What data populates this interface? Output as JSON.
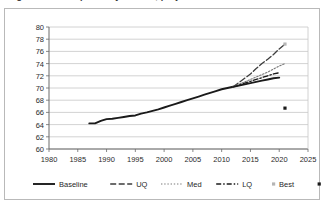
{
  "page": {
    "cutoff_title_fragment": "Figure 3. Life expectancy at birth, projections"
  },
  "chart_data": {
    "type": "line",
    "title": "",
    "xlabel": "",
    "ylabel": "",
    "xlim": [
      1980,
      2025
    ],
    "ylim": [
      60,
      80
    ],
    "xticks": [
      1980,
      1985,
      1990,
      1995,
      2000,
      2005,
      2010,
      2015,
      2020,
      2025
    ],
    "yticks": [
      60,
      62,
      64,
      66,
      68,
      70,
      72,
      74,
      76,
      78,
      80
    ],
    "grid": "horizontal",
    "legend_position": "bottom",
    "series": [
      {
        "name": "Baseline",
        "style": "solid",
        "color": "#1a1a1a",
        "x": [
          1987,
          1988,
          1989,
          1990,
          1991,
          1992,
          1993,
          1994,
          1995,
          1996,
          1997,
          1998,
          1999,
          2000,
          2001,
          2002,
          2003,
          2004,
          2005,
          2006,
          2007,
          2008,
          2009,
          2010,
          2011,
          2012,
          2013,
          2014,
          2015,
          2016,
          2017,
          2018,
          2019,
          2020
        ],
        "values": [
          64.2,
          64.2,
          64.6,
          64.9,
          64.95,
          65.1,
          65.25,
          65.4,
          65.5,
          65.8,
          66.0,
          66.25,
          66.5,
          66.8,
          67.1,
          67.4,
          67.7,
          68.0,
          68.3,
          68.6,
          68.9,
          69.2,
          69.5,
          69.8,
          70.0,
          70.2,
          70.4,
          70.6,
          70.8,
          71.0,
          71.2,
          71.4,
          71.6,
          71.7
        ]
      },
      {
        "name": "UQ",
        "style": "dashed",
        "color": "#3d3d3d",
        "x": [
          2012,
          2013,
          2014,
          2015,
          2016,
          2017,
          2018,
          2019,
          2020,
          2021
        ],
        "values": [
          70.2,
          70.9,
          71.6,
          72.3,
          73.2,
          74.0,
          74.7,
          75.5,
          76.4,
          77.2
        ]
      },
      {
        "name": "Med",
        "style": "dotted",
        "color": "#7a7a7a",
        "x": [
          2012,
          2013,
          2014,
          2015,
          2016,
          2017,
          2018,
          2019,
          2020,
          2021
        ],
        "values": [
          70.2,
          70.6,
          71.0,
          71.4,
          71.8,
          72.2,
          72.6,
          73.1,
          73.6,
          74.0
        ]
      },
      {
        "name": "LQ",
        "style": "dash-dot",
        "color": "#1a1a1a",
        "x": [
          2012,
          2013,
          2014,
          2015,
          2016,
          2017,
          2018,
          2019,
          2020
        ],
        "values": [
          70.2,
          70.5,
          70.8,
          71.1,
          71.4,
          71.7,
          72.0,
          72.3,
          72.5
        ]
      },
      {
        "name": "Best",
        "style": "marker",
        "marker": "square",
        "color": "#b5b5b5",
        "x": [
          2021
        ],
        "values": [
          77.2
        ]
      },
      {
        "name": "Worst",
        "style": "marker",
        "marker": "square",
        "color": "#1a1a1a",
        "x": [
          2021
        ],
        "values": [
          66.7
        ]
      }
    ]
  },
  "legend": {
    "items": [
      {
        "label": "Baseline",
        "style": "solid",
        "color": "#1a1a1a"
      },
      {
        "label": "UQ",
        "style": "dashed",
        "color": "#3d3d3d"
      },
      {
        "label": "Med",
        "style": "dotted",
        "color": "#7a7a7a"
      },
      {
        "label": "LQ",
        "style": "dash-dot",
        "color": "#1a1a1a"
      },
      {
        "label": "Best",
        "style": "marker",
        "color": "#b5b5b5"
      },
      {
        "label": "Worst",
        "style": "marker",
        "color": "#1a1a1a"
      }
    ]
  }
}
